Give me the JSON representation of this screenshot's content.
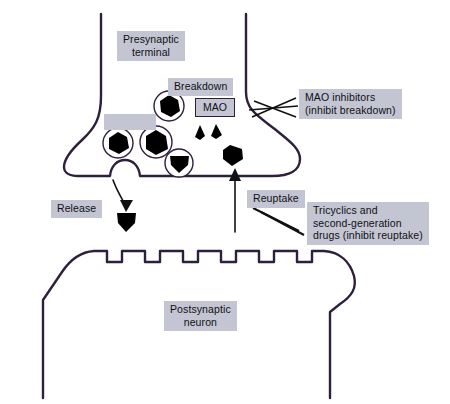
{
  "figure": {
    "canvas": {
      "width": 450,
      "height": 404
    },
    "colors": {
      "membrane_stroke": "#2e1f3c",
      "label_background": "#c3c5d2",
      "label_text": "#101014",
      "neurotransmitter_fill": "#000000",
      "background": "#ffffff"
    }
  },
  "labels": {
    "presynaptic_terminal": "Presynaptic\nterminal",
    "breakdown": "Breakdown",
    "mao": "MAO",
    "mao_inhibitors": "MAO inhibitors\n(inhibit breakdown)",
    "release": "Release",
    "reuptake": "Reuptake",
    "tricyclics": "Tricyclics and\nsecond-generation\ndrugs (inhibit reuptake)",
    "postsynaptic_neuron": "Postsynaptic\nneuron",
    "unlabeled_box": ""
  },
  "structures": {
    "presynaptic_terminal": {
      "name": "presynaptic terminal",
      "axon_left_x": 101,
      "axon_right_x": 246,
      "bulb_top_y": 95,
      "bulb_bottom_y": 176
    },
    "postsynaptic_neuron": {
      "name": "postsynaptic neuron",
      "membrane_top_y": 250,
      "receptor_notch_count": 7
    },
    "synaptic_cleft": {
      "top_y": 176,
      "bottom_y": 250
    }
  },
  "vesicles": [
    {
      "id": "vesicle-1",
      "cx": 169,
      "cy": 106,
      "r": 15
    },
    {
      "id": "vesicle-2",
      "cx": 118,
      "cy": 143,
      "r": 15
    },
    {
      "id": "vesicle-3",
      "cx": 156,
      "cy": 142,
      "r": 16
    },
    {
      "id": "vesicle-4",
      "cx": 179,
      "cy": 163,
      "r": 14
    }
  ],
  "neurotransmitters": [
    {
      "id": "nt-fragment-left",
      "cx": 200,
      "cy": 133,
      "size": "small"
    },
    {
      "id": "nt-fragment-right",
      "cx": 216,
      "cy": 132,
      "size": "small"
    },
    {
      "id": "nt-reuptake-blob",
      "cx": 232,
      "cy": 155,
      "size": "large"
    },
    {
      "id": "nt-released-blob",
      "cx": 126,
      "cy": 222,
      "size": "large"
    }
  ],
  "arrows": [
    {
      "id": "release-arrow",
      "label": "Release",
      "from": [
        114,
        180
      ],
      "to": [
        127,
        212
      ],
      "direction": "down"
    },
    {
      "id": "reuptake-arrow",
      "label": "Reuptake",
      "from": [
        235,
        232
      ],
      "to": [
        235,
        170
      ],
      "direction": "up"
    }
  ],
  "inhibition_markers": [
    {
      "id": "mao-inhibition-marker",
      "target": "mao",
      "style": "crossed-slashes"
    },
    {
      "id": "reuptake-inhibition-marker",
      "target": "reuptake-arrow",
      "style": "double-slash"
    }
  ]
}
